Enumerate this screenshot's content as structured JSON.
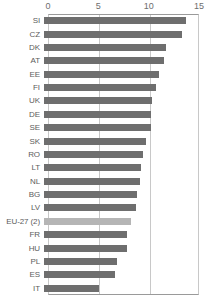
{
  "chart_data": {
    "type": "bar",
    "orientation": "horizontal",
    "title": "",
    "subtitle": "",
    "xlabel": "",
    "ylabel": "",
    "xlim": [
      0,
      15
    ],
    "xticks": [
      0,
      5,
      10,
      15
    ],
    "xtick_labels": [
      "0",
      "5",
      "10",
      "15"
    ],
    "grid": true,
    "grid_axis": "x",
    "legend": false,
    "categories": [
      "SI",
      "CZ",
      "DK",
      "AT",
      "EE",
      "FI",
      "UK",
      "DE",
      "SE",
      "SK",
      "RO",
      "LT",
      "NL",
      "BG",
      "LV",
      "EU-27 (2)",
      "FR",
      "HU",
      "PL",
      "ES",
      "IT"
    ],
    "values": [
      14.1,
      13.7,
      12.1,
      11.9,
      11.4,
      11.1,
      10.7,
      10.6,
      10.6,
      10.1,
      9.8,
      9.6,
      9.5,
      9.2,
      9.1,
      8.6,
      8.2,
      8.2,
      7.3,
      7.1,
      5.5
    ],
    "highlight_category": "EU-27 (2)",
    "colors": {
      "bar": "#6e6e6e",
      "bar_highlight": "#b5b5b5",
      "grid": "#c8c8c8",
      "axis": "#9a9a9a",
      "tick_label": "#6e6e6e",
      "category_label": "#5c5c5c",
      "background": "#ffffff"
    }
  }
}
